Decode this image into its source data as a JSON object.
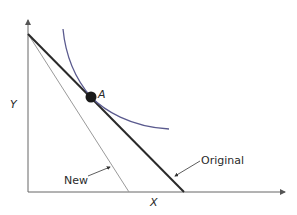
{
  "diagram": {
    "type": "budget-constraint-indifference-curve",
    "axes": {
      "x_label": "X",
      "y_label": "Y"
    },
    "point": {
      "label": "A"
    },
    "lines": [
      {
        "name": "original",
        "label": "Original",
        "color": "#2a2a2a"
      },
      {
        "name": "new",
        "label": "New",
        "color": "#9a9a9a"
      }
    ],
    "curve": {
      "name": "indifference-curve",
      "color": "#5a5a8e"
    }
  }
}
